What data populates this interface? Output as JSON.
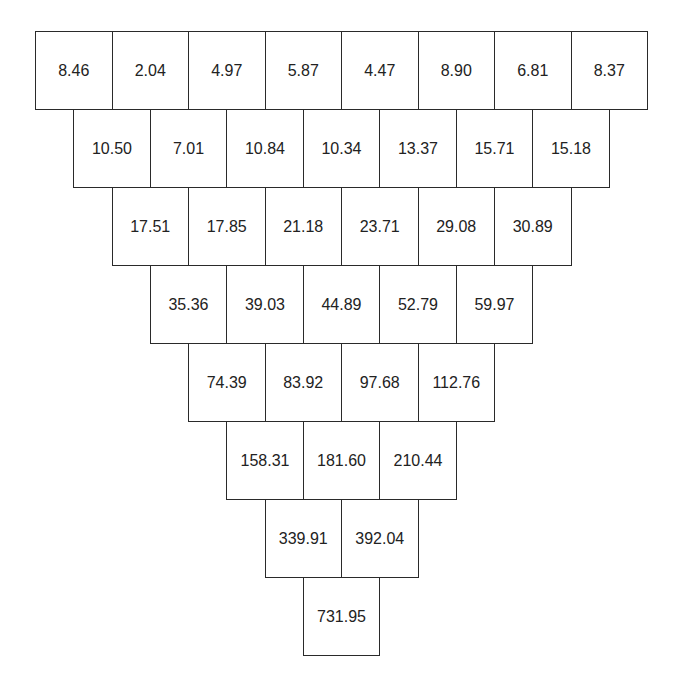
{
  "diagram": {
    "type": "number-pyramid",
    "rows": [
      [
        "8.46",
        "2.04",
        "4.97",
        "5.87",
        "4.47",
        "8.90",
        "6.81",
        "8.37"
      ],
      [
        "10.50",
        "7.01",
        "10.84",
        "10.34",
        "13.37",
        "15.71",
        "15.18"
      ],
      [
        "17.51",
        "17.85",
        "21.18",
        "23.71",
        "29.08",
        "30.89"
      ],
      [
        "35.36",
        "39.03",
        "44.89",
        "52.79",
        "59.97"
      ],
      [
        "74.39",
        "83.92",
        "97.68",
        "112.76"
      ],
      [
        "158.31",
        "181.60",
        "210.44"
      ],
      [
        "339.91",
        "392.04"
      ],
      [
        "731.95"
      ]
    ]
  }
}
